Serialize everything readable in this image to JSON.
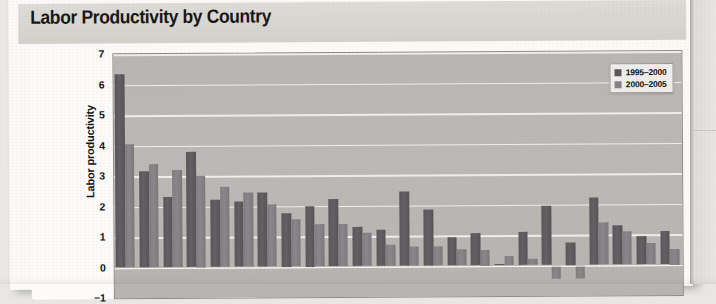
{
  "page": {
    "title": "Labor Productivity by Country"
  },
  "legend": {
    "position": "top-right",
    "entries": [
      {
        "label": "1995–2000",
        "color": "#5a585b"
      },
      {
        "label": "2000–2005",
        "color": "#858386"
      }
    ]
  },
  "chart_data": {
    "type": "bar",
    "title": "Labor Productivity by Country",
    "xlabel": "",
    "ylabel": "Labor productivity",
    "ylim": [
      -1,
      7
    ],
    "yticks": [
      7,
      6,
      5,
      4,
      3,
      2,
      1,
      0,
      -1
    ],
    "ytick_labels": [
      "7",
      "6",
      "5",
      "4",
      "3",
      "2",
      "1",
      "0",
      "−1"
    ],
    "grid": true,
    "grid_color": "#f4f3f1",
    "plot_background": "#b9b7b3",
    "categories": [
      "C1",
      "C2",
      "C3",
      "C4",
      "C5",
      "C6",
      "C7",
      "C8",
      "C9",
      "C10",
      "C11",
      "C12",
      "C13",
      "C14",
      "C15",
      "C16",
      "C17",
      "C18",
      "C19",
      "C20",
      "C21",
      "C22",
      "C23",
      "C24"
    ],
    "category_labels_visible": false,
    "series": [
      {
        "name": "1995–2000",
        "color": "#5a585b",
        "values": [
          6.35,
          3.15,
          2.3,
          3.8,
          2.2,
          2.15,
          2.45,
          1.75,
          2.0,
          2.2,
          1.3,
          1.2,
          2.45,
          1.85,
          0.95,
          1.05,
          0.05,
          1.1,
          1.95,
          0.75,
          2.2,
          1.3,
          0.95,
          1.1
        ]
      },
      {
        "name": "2000–2005",
        "color": "#858386",
        "values": [
          4.05,
          3.4,
          3.2,
          3.0,
          2.65,
          2.45,
          2.05,
          1.55,
          1.4,
          1.4,
          1.1,
          0.7,
          0.65,
          0.65,
          0.55,
          0.5,
          0.3,
          0.2,
          -0.45,
          -0.45,
          1.4,
          1.1,
          0.7,
          0.5
        ]
      }
    ]
  }
}
